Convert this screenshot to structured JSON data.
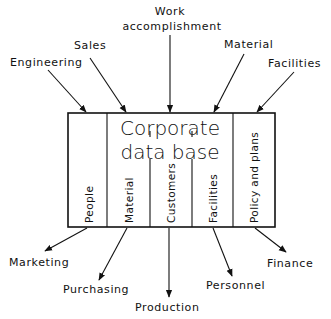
{
  "diagram": {
    "title_line1": "Corporate",
    "title_line2": "data base",
    "colors": {
      "ink": "#111111",
      "background": "#ffffff"
    },
    "inputs": [
      {
        "label": "Engineering"
      },
      {
        "label": "Sales"
      },
      {
        "label_line1": "Work",
        "label_line2": "accomplishment"
      },
      {
        "label": "Material"
      },
      {
        "label": "Facilities"
      }
    ],
    "columns": [
      {
        "label": "People"
      },
      {
        "label": "Material"
      },
      {
        "label": "Customers"
      },
      {
        "label": "Facilities"
      },
      {
        "label": "Policy and plans"
      }
    ],
    "outputs": [
      {
        "label": "Marketing"
      },
      {
        "label": "Purchasing"
      },
      {
        "label": "Production"
      },
      {
        "label": "Personnel"
      },
      {
        "label": "Finance"
      }
    ]
  }
}
